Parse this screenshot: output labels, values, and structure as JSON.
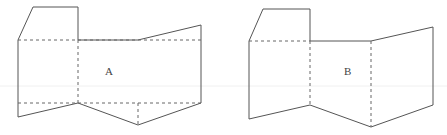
{
  "figures": [
    {
      "id": "A",
      "label": "A",
      "label_pos": [
        105,
        75
      ],
      "solid_paths": [
        "M18,40 L33,7 L78,7 L78,40",
        "M78,40 L138,40 L201,25 L201,103",
        "M18,40 L18,117 L78,103 L138,125 L201,103"
      ],
      "dashed_paths": [
        "M18,40 L201,40",
        "M18,103 L201,103",
        "M78,40 L78,103",
        "M138,103 L138,125"
      ]
    },
    {
      "id": "B",
      "label": "B",
      "label_pos": [
        344,
        75
      ],
      "solid_paths": [
        "M249,41 L263,9 L310,9 L310,41",
        "M310,41 L371,41 L433,27 L433,105",
        "M249,41 L249,119 L310,105 L371,127 L433,105"
      ],
      "dashed_paths": [
        "M249,41 L310,41",
        "M310,41 L310,105",
        "M371,41 L371,127"
      ]
    }
  ],
  "colors": {
    "stroke": "#555555",
    "dashed": "#666666",
    "text": "#444444",
    "background": "#ffffff"
  }
}
